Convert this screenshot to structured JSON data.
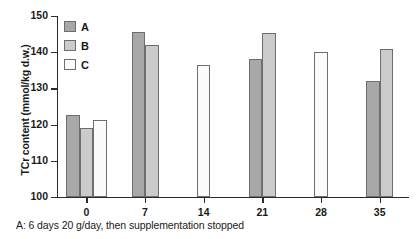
{
  "chart_data": {
    "type": "bar",
    "title": "",
    "xlabel": "",
    "ylabel": "TCr content (mmol/kg d.w.)",
    "categories": [
      "0",
      "7",
      "14",
      "21",
      "28",
      "35"
    ],
    "x": [
      0,
      7,
      14,
      21,
      28,
      35
    ],
    "ylim": [
      100,
      150
    ],
    "yticks": [
      100,
      110,
      120,
      130,
      140,
      150
    ],
    "ytick_labels": [
      "100",
      "110",
      "120",
      "130",
      "140",
      "150"
    ],
    "xlim": [
      -3.5,
      38.5
    ],
    "xticks": [
      0,
      7,
      14,
      21,
      28,
      35
    ],
    "xtick_labels": [
      "0",
      "7",
      "14",
      "21",
      "28",
      "35"
    ],
    "grid": false,
    "legend_position": "upper-left-inside",
    "series": [
      {
        "name": "A",
        "color": "#a8a8a8",
        "values": [
          122.7,
          145.5,
          null,
          138.2,
          null,
          132.0
        ]
      },
      {
        "name": "B",
        "color": "#cbcbcb",
        "values": [
          119.0,
          142.0,
          null,
          145.4,
          null,
          141.0
        ]
      },
      {
        "name": "C",
        "color": "#fbfbfb",
        "values": [
          121.2,
          null,
          136.5,
          null,
          140.0,
          null
        ]
      }
    ],
    "annotations": [
      "A: 6 days 20 g/day, then supplementation stopped"
    ]
  },
  "legend": {
    "items": [
      {
        "label": "A",
        "swatch": "legend-swatch-a"
      },
      {
        "label": "B",
        "swatch": "legend-swatch-b"
      },
      {
        "label": "C",
        "swatch": "legend-swatch-c"
      }
    ]
  },
  "axes": {
    "y_title": "TCr content (mmol/kg d.w.)",
    "y_labels": [
      "150",
      "140",
      "130",
      "120",
      "110",
      "100"
    ],
    "x_labels": [
      "0",
      "7",
      "14",
      "21",
      "28",
      "35"
    ]
  },
  "caption": {
    "text": "A: 6 days 20 g/day, then supplementation stopped"
  }
}
